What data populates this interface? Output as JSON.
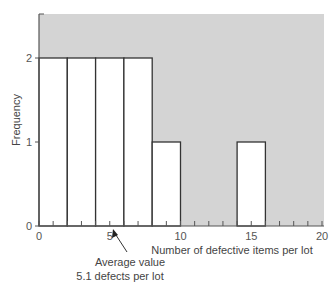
{
  "chart_data": {
    "type": "bar",
    "subtype": "histogram",
    "title": "",
    "xlabel": "Number of defective items per lot",
    "ylabel": "Frequency",
    "xlim": [
      0,
      20
    ],
    "ylim": [
      0,
      2.5
    ],
    "x_ticks": [
      0,
      5,
      10,
      15,
      20
    ],
    "x_minor_tick_step": 1,
    "y_ticks": [
      0,
      1,
      2
    ],
    "bins": [
      {
        "start": 0,
        "end": 2,
        "frequency": 2
      },
      {
        "start": 2,
        "end": 4,
        "frequency": 2
      },
      {
        "start": 4,
        "end": 6,
        "frequency": 2
      },
      {
        "start": 6,
        "end": 8,
        "frequency": 2
      },
      {
        "start": 8,
        "end": 10,
        "frequency": 1
      },
      {
        "start": 14,
        "end": 16,
        "frequency": 1
      }
    ],
    "categories": [
      "0-2",
      "2-4",
      "4-6",
      "6-8",
      "8-10",
      "10-12",
      "12-14",
      "14-16",
      "16-18",
      "18-20"
    ],
    "values": [
      2,
      2,
      2,
      2,
      1,
      0,
      0,
      1,
      0,
      0
    ],
    "annotations": [
      {
        "text_line1": "Average value",
        "text_line2": "5.1 defects per lot",
        "x": 5.1,
        "arrow": true
      }
    ],
    "grid": false,
    "legend": "none",
    "colors": {
      "background": "#d4d4d4",
      "bar_fill": "#ffffff",
      "bar_stroke": "#333333",
      "axis": "#555555"
    }
  },
  "labels": {
    "y_title": "Frequency",
    "x_title": "Number of defective items per lot",
    "annotation_line1": "Average value",
    "annotation_line2": "5.1 defects per lot",
    "x_tick_labels": [
      "0",
      "5",
      "10",
      "15",
      "20"
    ],
    "y_tick_labels": [
      "0",
      "1",
      "2"
    ]
  }
}
